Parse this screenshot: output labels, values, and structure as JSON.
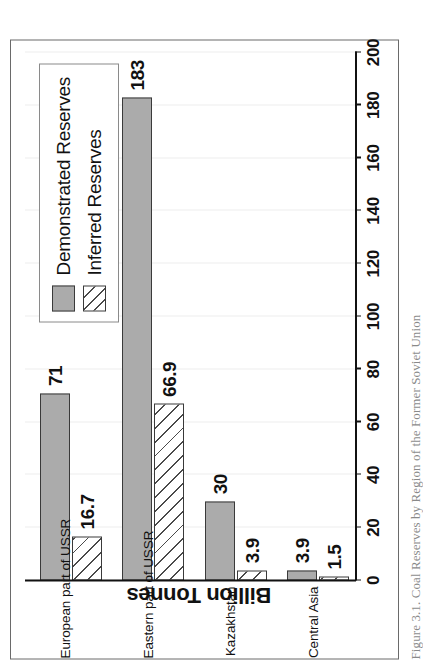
{
  "figure": {
    "caption": "Figure 3.1.  Coal Reserves by Region of the Former Soviet Union"
  },
  "legend": {
    "items": [
      {
        "label": "Demonstrated Reserves",
        "swatch": "solid-gray-swatch",
        "color": "#ababab"
      },
      {
        "label": "Inferred Reserves",
        "swatch": "diagonal-hatch-swatch",
        "color": "#ffffff"
      }
    ]
  },
  "chart_data": {
    "type": "bar",
    "orientation": "horizontal",
    "title": "",
    "xlabel": "",
    "ylabel": "Billion Tonnes",
    "ylim": [
      0,
      200
    ],
    "yticks": [
      0,
      20,
      40,
      60,
      80,
      100,
      120,
      140,
      160,
      180,
      200
    ],
    "ytick_labels": [
      "0",
      "20",
      "40",
      "60",
      "80",
      "100",
      "120",
      "140",
      "160",
      "180",
      "200"
    ],
    "grid": true,
    "legend_position": "top-right",
    "categories": [
      "European part of USSR",
      "Eastern part of USSR",
      "Kazakhstan",
      "Central Asia"
    ],
    "series": [
      {
        "name": "Demonstrated Reserves",
        "color": "#ababab",
        "values": [
          71,
          183,
          30,
          3.9
        ],
        "labels": [
          "71",
          "183",
          "30",
          "3.9"
        ]
      },
      {
        "name": "Inferred Reserves",
        "color": "#ffffff",
        "values": [
          16.7,
          66.9,
          3.9,
          1.5
        ],
        "labels": [
          "16.7",
          "66.9",
          "3.9",
          "1.5"
        ]
      }
    ]
  }
}
